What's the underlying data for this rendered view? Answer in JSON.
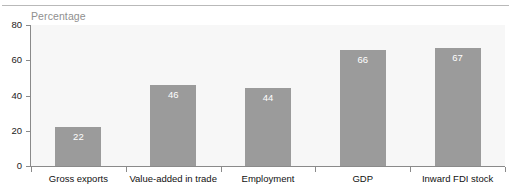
{
  "figure": {
    "top_rule": "divider",
    "title_remnant": "",
    "axis_title": "Percentage"
  },
  "chart_data": {
    "type": "bar",
    "title": "",
    "subtitle": "",
    "xlabel": "",
    "ylabel": "Percentage",
    "ylim": [
      0,
      80
    ],
    "yticks": [
      0,
      20,
      40,
      60,
      80
    ],
    "ytick_labels": [
      "0",
      "20",
      "40",
      "60",
      "80"
    ],
    "grid": false,
    "legend": null,
    "bar_color": "#9b9b9b",
    "plot_background": "#f7f7f7",
    "value_label_color": "#ffffff",
    "categories": [
      "Gross exports",
      "Value-added in trade",
      "Employment",
      "GDP",
      "Inward FDI stock"
    ],
    "values": [
      22,
      46,
      44,
      66,
      67
    ],
    "value_labels": [
      "22",
      "46",
      "44",
      "66",
      "67"
    ]
  }
}
